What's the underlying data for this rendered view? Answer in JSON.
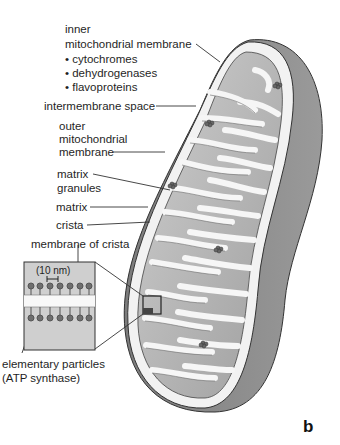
{
  "figure": {
    "panel_letter": "b"
  },
  "labels": {
    "inner_membrane_line1": "inner",
    "inner_membrane_line2": "mitochondrial membrane",
    "inner_membrane_bullets": [
      "• cytochromes",
      "• dehydrogenases",
      "• flavoproteins"
    ],
    "intermembrane_space": "intermembrane space",
    "outer_membrane_line1": "outer",
    "outer_membrane_line2": "mitochondrial",
    "outer_membrane_line3": "membrane",
    "matrix_granules_line1": "matrix",
    "matrix_granules_line2": "granules",
    "matrix": "matrix",
    "crista": "crista",
    "membrane_of_crista": "membrane of crista",
    "scale": "(10 nm)",
    "elementary_particles_line1": "elementary particles",
    "elementary_particles_line2": "(ATP synthase)"
  },
  "colors": {
    "outer_shell": "#8a8a8a",
    "membrane_white": "#f4f4f4",
    "matrix_gray": "#b8b8b8",
    "line": "#333333"
  }
}
